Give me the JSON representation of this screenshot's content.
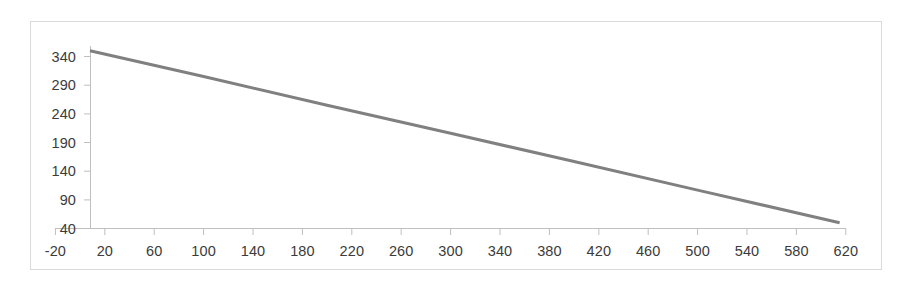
{
  "chart_data": {
    "type": "line",
    "title": "",
    "subtitle": "",
    "xlabel": "",
    "ylabel": "",
    "grid": false,
    "legend": false,
    "legend_position": "none",
    "line_color": "#808080",
    "line_width": 3,
    "border_color": "#d9d9d9",
    "axis_color": "#bfbfbf",
    "background": "#ffffff",
    "xlim": [
      -20,
      620
    ],
    "ylim": [
      40,
      350
    ],
    "x_ticks": [
      -20,
      20,
      60,
      100,
      140,
      180,
      220,
      260,
      300,
      340,
      380,
      420,
      460,
      500,
      540,
      580,
      620
    ],
    "x_tick_labels": [
      "-20",
      "20",
      "60",
      "100",
      "140",
      "180",
      "220",
      "260",
      "300",
      "340",
      "380",
      "420",
      "460",
      "500",
      "540",
      "580",
      "620"
    ],
    "y_ticks": [
      40,
      90,
      140,
      190,
      240,
      290,
      340
    ],
    "y_tick_labels": [
      "40",
      "90",
      "140",
      "190",
      "240",
      "290",
      "340"
    ],
    "series": [
      {
        "name": "series-1",
        "color": "#808080",
        "x": [
          8,
          615
        ],
        "y": [
          350,
          50
        ],
        "points": [
          {
            "x": 8,
            "y": 350
          },
          {
            "x": 100,
            "y": 305
          },
          {
            "x": 200,
            "y": 255
          },
          {
            "x": 300,
            "y": 206
          },
          {
            "x": 400,
            "y": 157
          },
          {
            "x": 500,
            "y": 107
          },
          {
            "x": 615,
            "y": 50
          }
        ],
        "slope": -0.494,
        "intercept": 354
      }
    ]
  }
}
